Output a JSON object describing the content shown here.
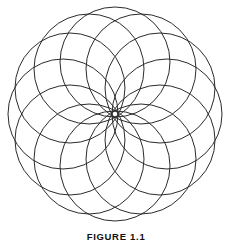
{
  "page": {
    "background_color": "#ffffff",
    "width": 232,
    "height": 241
  },
  "figure": {
    "title": "FIGURE 1.1",
    "caption": "FIGURE 1.1",
    "alt_description": "Twelve overlapping circles arranged in a ring forming a twelve-petal rosette / spirograph pattern",
    "stroke_color": "#2b2b2b",
    "stroke_width": 1,
    "fill": "none"
  },
  "chart_data": {
    "type": "scatter",
    "title": "FIGURE 1.1",
    "subtitle": "",
    "xlabel": "",
    "ylabel": "",
    "grid": false,
    "legend_position": "none",
    "geometry": {
      "shape_name": "rosette",
      "element_count": 12,
      "center_x": 115,
      "center_y": 114,
      "ring_radius": 52,
      "circle_radius": 55,
      "outer_radius": 107,
      "inner_cusp_radius": 55,
      "angle_step_degrees": 30,
      "start_angle_degrees": -90
    },
    "categories": [
      "circle-1",
      "circle-2",
      "circle-3",
      "circle-4",
      "circle-5",
      "circle-6",
      "circle-7",
      "circle-8",
      "circle-9",
      "circle-10",
      "circle-11",
      "circle-12"
    ],
    "angles_degrees": [
      -90,
      -60,
      -30,
      0,
      30,
      60,
      90,
      120,
      150,
      180,
      210,
      240
    ],
    "values": [
      55,
      55,
      55,
      55,
      55,
      55,
      55,
      55,
      55,
      55,
      55,
      55
    ],
    "xlim": [
      8,
      222
    ],
    "ylim": [
      8,
      220
    ]
  }
}
